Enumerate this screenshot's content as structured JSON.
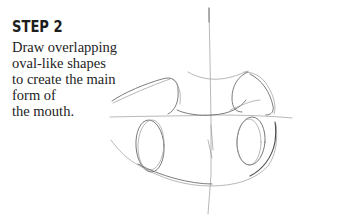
{
  "step": {
    "heading": "STEP 2",
    "instruction_lines": [
      "Draw overlapping",
      "oval-like shapes",
      "to create the main",
      "form of",
      "the mouth."
    ]
  },
  "illustration": {
    "subject": "pencil sketch of mouth with overlapping oval-like shapes",
    "stroke_color": "#555555",
    "background": "#ffffff"
  }
}
